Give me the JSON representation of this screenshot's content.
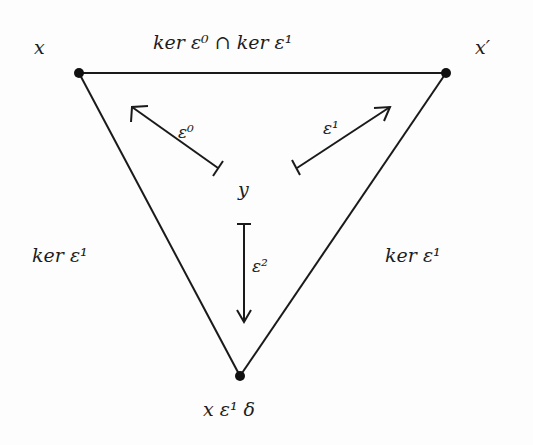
{
  "diagram": {
    "vertices": {
      "top_left": {
        "label": "x"
      },
      "top_right": {
        "label": "x′"
      },
      "bottom": {
        "label": "x ε¹ δ"
      }
    },
    "center": {
      "label": "y"
    },
    "edges": {
      "top": {
        "label": "ker ε⁰ ∩ ker ε¹"
      },
      "left": {
        "label": "ker ε¹"
      },
      "right": {
        "label": "ker ε¹"
      }
    },
    "arrows": {
      "to_top_left": {
        "label": "ε⁰"
      },
      "to_top_right": {
        "label": "ε¹"
      },
      "to_bottom": {
        "label": "ε²"
      }
    }
  }
}
